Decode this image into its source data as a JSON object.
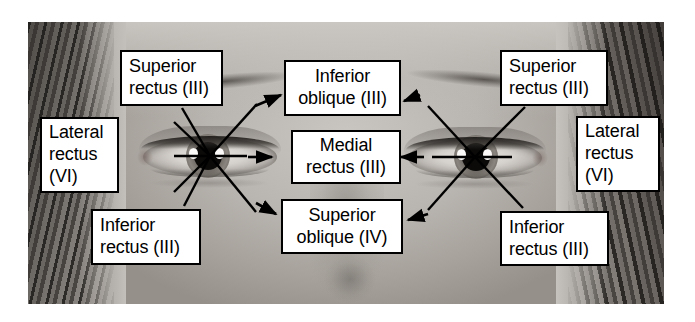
{
  "figure": {
    "photo_alt": "Close-up photograph of a person's eyes and forehead"
  },
  "colors": {
    "box_fill": "#ffffff",
    "box_border": "#000000",
    "line": "#000000",
    "page_background": "#ffffff"
  },
  "labels": {
    "left_superior_rectus": {
      "line1": "Superior",
      "line2": "rectus (III)"
    },
    "left_lateral_rectus": {
      "line1": "Lateral",
      "line2": "rectus",
      "line3": "(VI)"
    },
    "left_inferior_rectus": {
      "line1": "Inferior",
      "line2": "rectus (III)"
    },
    "center_inferior_oblique": {
      "line1": "Inferior",
      "line2": "oblique (III)"
    },
    "center_medial_rectus": {
      "line1": "Medial",
      "line2": "rectus (III)"
    },
    "center_superior_oblique": {
      "line1": "Superior",
      "line2": "oblique (IV)"
    },
    "right_superior_rectus": {
      "line1": "Superior",
      "line2": "rectus (III)"
    },
    "right_lateral_rectus": {
      "line1": "Lateral",
      "line2": "rectus",
      "line3": "(VI)"
    },
    "right_inferior_rectus": {
      "line1": "Inferior",
      "line2": "rectus (III)"
    }
  },
  "anatomy": {
    "left_eye_pupil": {
      "x": 210,
      "y": 156
    },
    "right_eye_pupil": {
      "x": 475,
      "y": 157
    },
    "muscles": [
      {
        "name": "Superior rectus",
        "nerve": "III",
        "nerve_name": "oculomotor"
      },
      {
        "name": "Inferior rectus",
        "nerve": "III",
        "nerve_name": "oculomotor"
      },
      {
        "name": "Medial rectus",
        "nerve": "III",
        "nerve_name": "oculomotor"
      },
      {
        "name": "Inferior oblique",
        "nerve": "III",
        "nerve_name": "oculomotor"
      },
      {
        "name": "Superior oblique",
        "nerve": "IV",
        "nerve_name": "trochlear"
      },
      {
        "name": "Lateral rectus",
        "nerve": "VI",
        "nerve_name": "abducens"
      }
    ]
  }
}
